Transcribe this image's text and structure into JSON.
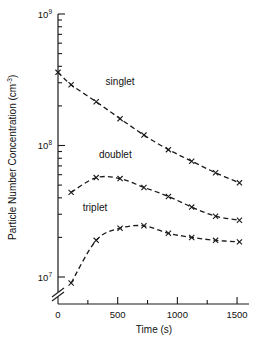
{
  "chart_data": {
    "type": "line",
    "title": "",
    "xlabel": "Time (s)",
    "ylabel": "Particle Number Concentration (cm",
    "ylabel_sup": "-3",
    "ylabel_suffix": ")",
    "xlim": [
      0,
      1600
    ],
    "ylim": [
      7000000,
      1000000000
    ],
    "yscale": "log",
    "xscale": "linear",
    "grid": false,
    "legend_position": "inline-annotations",
    "axis_break": "y-axis broken below lowest decade",
    "x_major_ticks": [
      0,
      500,
      1000,
      1500
    ],
    "x_major_tick_labels": [
      "0",
      "500",
      "1000",
      "1500"
    ],
    "x_minor_ticks": [
      250,
      750,
      1250
    ],
    "y_major_ticks": [
      10000000,
      100000000,
      1000000000
    ],
    "y_major_tick_labels": [
      "10",
      "10",
      "10"
    ],
    "y_major_tick_exponents": [
      "7",
      "8",
      "9"
    ],
    "y_minor_decades": [
      2,
      3,
      4,
      5,
      6,
      7,
      8,
      9
    ],
    "marker_style": "x",
    "line_style": "dashed",
    "series": [
      {
        "name": "singlet",
        "label": "singlet",
        "label_x": 520,
        "label_y": 290000000,
        "x": [
          0,
          110,
          320,
          520,
          720,
          925,
          1120,
          1320,
          1520
        ],
        "y": [
          360000000,
          290000000,
          215000000,
          160000000,
          120000000,
          93000000,
          76000000,
          62000000,
          52000000
        ]
      },
      {
        "name": "doublet",
        "label": "doublet",
        "label_x": 480,
        "label_y": 80000000,
        "x": [
          110,
          320,
          520,
          720,
          925,
          1120,
          1320,
          1520
        ],
        "y": [
          44000000,
          57000000,
          56000000,
          48000000,
          41000000,
          34000000,
          29000000,
          27000000
        ]
      },
      {
        "name": "triplet",
        "label": "triplet",
        "label_x": 310,
        "label_y": 32000000,
        "x": [
          110,
          320,
          520,
          720,
          925,
          1120,
          1320,
          1520
        ],
        "y": [
          9000000,
          19000000,
          23500000,
          24500000,
          21500000,
          20000000,
          19000000,
          18500000
        ]
      }
    ]
  }
}
